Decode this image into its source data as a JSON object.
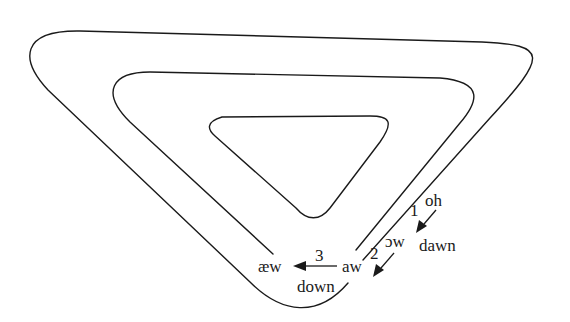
{
  "diagram": {
    "type": "nested-spiral-vowel-shift",
    "shape": "inverted rounded triangle spiral with three nested loops",
    "stroke_color": "#1a1a1a",
    "background": "#ffffff",
    "labels": {
      "oh": "oh",
      "open_o_w": "ɔw",
      "aw": "aw",
      "ae_w": "æw",
      "dawn": "dawn",
      "down": "down"
    },
    "steps": [
      {
        "number": "1",
        "from": "oh",
        "to": "ɔw"
      },
      {
        "number": "2",
        "from": "ɔw",
        "to": "aw"
      },
      {
        "number": "3",
        "from": "aw",
        "to": "æw"
      }
    ]
  }
}
